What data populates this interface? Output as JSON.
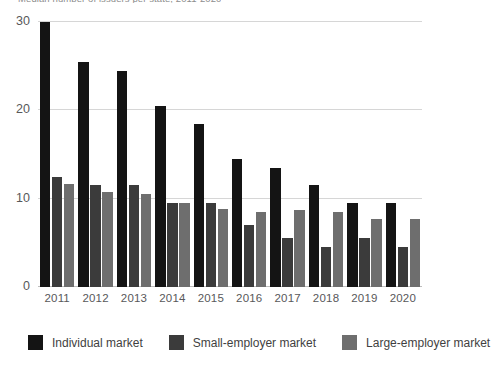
{
  "chart_data": {
    "type": "bar",
    "title": "Median number of issuers per state, 2011-2020",
    "xlabel": "",
    "ylabel": "",
    "ylim": [
      0,
      30
    ],
    "yticks": [
      0,
      10,
      20,
      30
    ],
    "grid": true,
    "legend_position": "bottom-left",
    "categories": [
      "2011",
      "2012",
      "2013",
      "2014",
      "2015",
      "2016",
      "2017",
      "2018",
      "2019",
      "2020"
    ],
    "series": [
      {
        "name": "Individual market",
        "color": "#141414",
        "values": [
          30.0,
          25.5,
          24.5,
          20.5,
          18.5,
          14.5,
          13.5,
          11.5,
          9.5,
          9.5
        ]
      },
      {
        "name": "Small-employer market",
        "color": "#3b3b3b",
        "values": [
          12.5,
          11.5,
          11.5,
          9.5,
          9.5,
          7.0,
          5.5,
          4.5,
          5.5,
          4.5
        ]
      },
      {
        "name": "Large-employer market",
        "color": "#6e6e6e",
        "values": [
          11.7,
          10.7,
          10.5,
          9.5,
          8.8,
          8.5,
          8.7,
          8.5,
          7.7,
          7.7
        ]
      }
    ]
  },
  "legend": {
    "items": [
      {
        "label": "Individual market"
      },
      {
        "label": "Small-employer market"
      },
      {
        "label": "Large-employer market"
      }
    ]
  }
}
